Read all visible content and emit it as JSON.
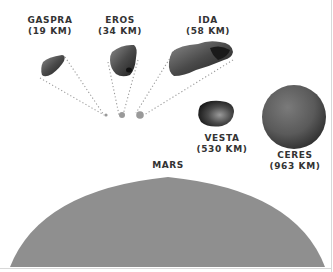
{
  "bodies": [
    {
      "name": "GASPRA",
      "size": "(19 KM)"
    },
    {
      "name": "EROS",
      "size": "(34 KM)"
    },
    {
      "name": "IDA",
      "size": "(58 KM)"
    },
    {
      "name": "VESTA",
      "size": "(530 KM)"
    },
    {
      "name": "CERES",
      "size": "(963 KM)"
    },
    {
      "name": "MARS"
    }
  ],
  "colors": {
    "mars": "#8f8f8f",
    "ceres": "#5e5e5e",
    "text": "#333333",
    "dots": "#999999"
  }
}
